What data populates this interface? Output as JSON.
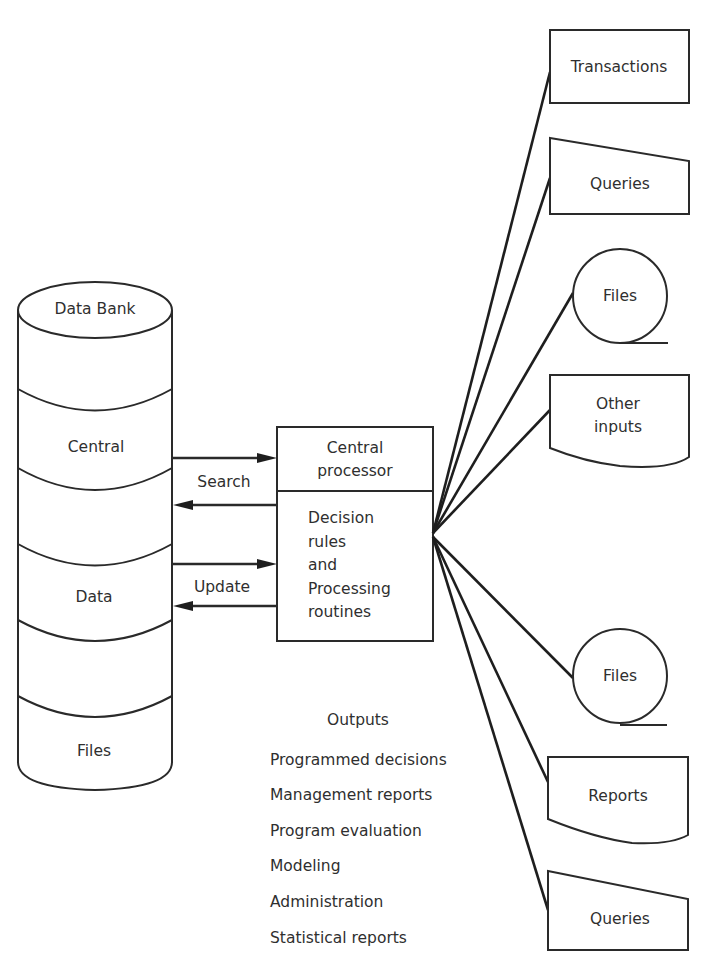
{
  "data_bank": {
    "title": "Data Bank",
    "segments": [
      "Central",
      "",
      "Data",
      "",
      "Files"
    ]
  },
  "processor": {
    "header_lines": [
      "Central",
      "processor"
    ],
    "body_lines": [
      "Decision",
      "rules",
      "and",
      "Processing",
      "routines"
    ]
  },
  "flows": {
    "search_label": "Search",
    "update_label": "Update"
  },
  "inputs": [
    {
      "label": "Transactions",
      "shape": "rectangle"
    },
    {
      "label": "Queries",
      "shape": "manual-input"
    },
    {
      "label": "Files",
      "shape": "magnetic-tape"
    },
    {
      "label_lines": [
        "Other",
        "inputs"
      ],
      "shape": "document"
    }
  ],
  "outputs_devices": [
    {
      "label": "Files",
      "shape": "magnetic-tape"
    },
    {
      "label": "Reports",
      "shape": "document"
    },
    {
      "label": "Queries",
      "shape": "manual-input"
    }
  ],
  "outputs_list": {
    "title": "Outputs",
    "items": [
      "Programmed decisions",
      "Management reports",
      "Program evaluation",
      "Modeling",
      "Administration",
      "Statistical reports"
    ]
  }
}
